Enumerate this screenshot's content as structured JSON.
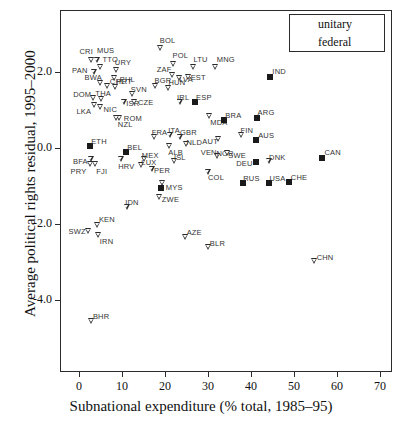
{
  "chart_data": {
    "type": "scatter",
    "title": "",
    "xlabel": "Subnational expenditure (% total, 1985–95)",
    "ylabel": "Average political rights residual, 1995–2000",
    "xlim": [
      -2,
      72
    ],
    "ylim": [
      -5.0,
      3.0
    ],
    "xticks": [
      0,
      10,
      20,
      30,
      40,
      50,
      60,
      70
    ],
    "xticklabels": [
      "0",
      "10",
      "20",
      "30",
      "40",
      "50",
      "60",
      "70"
    ],
    "yticks": [
      2.0,
      0.0,
      -2.0,
      -4.0
    ],
    "yticklabels": [
      "2.0",
      "0.0",
      "-2.0",
      "-4.0"
    ],
    "grid": false,
    "legend": {
      "position": "top-right",
      "entries": [
        {
          "label": "unitary",
          "marker": "triangle-down-open"
        },
        {
          "label": "federal",
          "marker": "square-filled"
        }
      ]
    },
    "series": [
      {
        "name": "unitary",
        "marker": "triangle-down-open",
        "points": [
          {
            "label": "CRI",
            "x": 2.9,
            "y": 2.32,
            "lx": -12,
            "ly": -13
          },
          {
            "label": "MUS",
            "x": 4.2,
            "y": 2.32,
            "lx": 0,
            "ly": -14
          },
          {
            "label": "TTO",
            "x": 5.0,
            "y": 2.14,
            "lx": 2,
            "ly": -12
          },
          {
            "label": "PAN",
            "x": 3.5,
            "y": 2.0,
            "lx": -22,
            "ly": -6
          },
          {
            "label": "URY",
            "x": 8.8,
            "y": 2.04,
            "lx": -2,
            "ly": -12
          },
          {
            "label": "BOL",
            "x": 19.0,
            "y": 2.62,
            "lx": -1,
            "ly": -12
          },
          {
            "label": "POL",
            "x": 22.0,
            "y": 2.22,
            "lx": -1,
            "ly": -13
          },
          {
            "label": "LTU",
            "x": 26.6,
            "y": 2.14,
            "lx": 0,
            "ly": -12
          },
          {
            "label": "MNG",
            "x": 31.8,
            "y": 2.12,
            "lx": 1,
            "ly": -12
          },
          {
            "label": "ZAF",
            "x": 21.8,
            "y": 1.93,
            "lx": -16,
            "ly": -10
          },
          {
            "label": "PHL",
            "x": 8.3,
            "y": 1.85,
            "lx": 5,
            "ly": -3
          },
          {
            "label": "BWA",
            "x": 5.0,
            "y": 1.7,
            "lx": -16,
            "ly": -10
          },
          {
            "label": "CHL",
            "x": 6.7,
            "y": 1.62,
            "lx": 2,
            "ly": -9
          },
          {
            "label": "PRT",
            "x": 8.5,
            "y": 1.6,
            "lx": 1,
            "ly": -10
          },
          {
            "label": "BGR",
            "x": 17.8,
            "y": 1.62,
            "lx": -1,
            "ly": -10
          },
          {
            "label": "HUN",
            "x": 20.8,
            "y": 1.58,
            "lx": 0,
            "ly": -10
          },
          {
            "label": "LVA",
            "x": 23.3,
            "y": 1.83,
            "lx": 0,
            "ly": -3
          },
          {
            "label": "EST",
            "x": 25.5,
            "y": 1.88,
            "lx": 2,
            "ly": -4
          },
          {
            "label": "DOM",
            "x": 3.3,
            "y": 1.32,
            "lx": -20,
            "ly": -8
          },
          {
            "label": "THA",
            "x": 5.2,
            "y": 1.3,
            "lx": -6,
            "ly": -10
          },
          {
            "label": "SVN",
            "x": 12.5,
            "y": 1.42,
            "lx": -2,
            "ly": -9
          },
          {
            "label": "ISR",
            "x": 10.5,
            "y": 1.2,
            "lx": 2,
            "ly": -3
          },
          {
            "label": "CZE",
            "x": 13.0,
            "y": 1.22,
            "lx": 3,
            "ly": -4
          },
          {
            "label": "IRL",
            "x": 23.5,
            "y": 1.22,
            "lx": -3,
            "ly": -9
          },
          {
            "label": "NIC",
            "x": 5.0,
            "y": 1.07,
            "lx": 3,
            "ly": -2
          },
          {
            "label": "LKA",
            "x": 3.6,
            "y": 1.12,
            "lx": -18,
            "ly": 2
          },
          {
            "label": "ROM",
            "x": 9.5,
            "y": 0.8,
            "lx": 4,
            "ly": -4
          },
          {
            "label": "NZL",
            "x": 8.8,
            "y": 0.8,
            "lx": 1,
            "ly": 2
          },
          {
            "label": "MDA",
            "x": 30.3,
            "y": 0.85,
            "lx": 1,
            "ly": 2
          },
          {
            "label": "FRA",
            "x": 17.6,
            "y": 0.28,
            "lx": -3,
            "ly": -9
          },
          {
            "label": "ITA",
            "x": 21.2,
            "y": 0.33,
            "lx": -2,
            "ly": -9
          },
          {
            "label": "GBR",
            "x": 23.5,
            "y": 0.3,
            "lx": 0,
            "ly": -9
          },
          {
            "label": "FIN",
            "x": 37.8,
            "y": 0.33,
            "lx": -1,
            "ly": -9
          },
          {
            "label": "AUT",
            "x": 32.4,
            "y": 0.23,
            "lx": -16,
            "ly": -2
          },
          {
            "label": "NLD",
            "x": 25.0,
            "y": 0.1,
            "lx": 0,
            "ly": -6
          },
          {
            "label": "ALB",
            "x": 21.0,
            "y": 0.06,
            "lx": -1,
            "ly": 2
          },
          {
            "label": "NOR",
            "x": 32.2,
            "y": -0.22,
            "lx": -1,
            "ly": -7
          },
          {
            "label": "SWE",
            "x": 34.5,
            "y": -0.12,
            "lx": 1,
            "ly": -2
          },
          {
            "label": "MEX",
            "x": 15.3,
            "y": -0.28,
            "lx": -3,
            "ly": -8
          },
          {
            "label": "ISL",
            "x": 22.3,
            "y": -0.33,
            "lx": -1,
            "ly": -8
          },
          {
            "label": "DNK",
            "x": 44.2,
            "y": -0.33,
            "lx": 0,
            "ly": -8
          },
          {
            "label": "BFA",
            "x": 2.8,
            "y": -0.28,
            "lx": -18,
            "ly": -2
          },
          {
            "label": "PRY",
            "x": 2.7,
            "y": -0.42,
            "lx": -20,
            "ly": 3
          },
          {
            "label": "FJI",
            "x": 3.8,
            "y": -0.42,
            "lx": 1,
            "ly": 3
          },
          {
            "label": "HRV",
            "x": 9.8,
            "y": -0.3,
            "lx": -3,
            "ly": 3
          },
          {
            "label": "LUX",
            "x": 14.5,
            "y": -0.45,
            "lx": 0,
            "ly": -7
          },
          {
            "label": "PER",
            "x": 17.0,
            "y": -0.55,
            "lx": 2,
            "ly": -3
          },
          {
            "label": "COL",
            "x": 30.0,
            "y": -0.62,
            "lx": 0,
            "ly": 1
          },
          {
            "label": "MYS",
            "x": 19.5,
            "y": -0.93,
            "lx": 3,
            "ly": 0
          },
          {
            "label": "ZWE",
            "x": 18.8,
            "y": -1.3,
            "lx": 2,
            "ly": -2
          },
          {
            "label": "IDN",
            "x": 11.2,
            "y": -1.55,
            "lx": -2,
            "ly": -9
          },
          {
            "label": "KEN",
            "x": 4.4,
            "y": -2.02,
            "lx": 1,
            "ly": -10
          },
          {
            "label": "SWZ",
            "x": 2.2,
            "y": -2.18,
            "lx": -20,
            "ly": -4
          },
          {
            "label": "IRN",
            "x": 4.6,
            "y": -2.3,
            "lx": 1,
            "ly": 2
          },
          {
            "label": "AZE",
            "x": 24.8,
            "y": -2.35,
            "lx": 1,
            "ly": -9
          },
          {
            "label": "BLR",
            "x": 30.2,
            "y": -2.6,
            "lx": 1,
            "ly": -8
          },
          {
            "label": "CHN",
            "x": 54.8,
            "y": -2.97,
            "lx": 2,
            "ly": -8
          },
          {
            "label": "BHR",
            "x": 3.0,
            "y": -4.55,
            "lx": 1,
            "ly": -9
          }
        ]
      },
      {
        "name": "federal",
        "marker": "square-filled",
        "points": [
          {
            "label": "IND",
            "x": 44.5,
            "y": 1.88,
            "lx": 2,
            "ly": -10
          },
          {
            "label": "ESP",
            "x": 27.0,
            "y": 1.2,
            "lx": 1,
            "ly": -9
          },
          {
            "label": "BRA",
            "x": 33.8,
            "y": 0.73,
            "lx": 1,
            "ly": -9
          },
          {
            "label": "ARG",
            "x": 41.3,
            "y": 0.78,
            "lx": 1,
            "ly": -10
          },
          {
            "label": "AUS",
            "x": 41.2,
            "y": 0.22,
            "lx": 2,
            "ly": -9
          },
          {
            "label": "ETH",
            "x": 2.6,
            "y": 0.05,
            "lx": 1,
            "ly": -9
          },
          {
            "label": "BEL",
            "x": 11.0,
            "y": -0.1,
            "lx": 1,
            "ly": -9
          },
          {
            "label": "CHE",
            "x": 48.8,
            "y": -0.9,
            "lx": 2,
            "ly": -9
          },
          {
            "label": "DEU",
            "x": 41.2,
            "y": -0.38,
            "lx": -20,
            "ly": -3
          },
          {
            "label": "USA",
            "x": 44.3,
            "y": -0.92,
            "lx": 0,
            "ly": -9
          },
          {
            "label": "RUS",
            "x": 38.2,
            "y": -0.93,
            "lx": 0,
            "ly": -9
          },
          {
            "label": "CAN",
            "x": 56.6,
            "y": -0.25,
            "lx": 2,
            "ly": -10
          },
          {
            "label": "VEN",
            "x": 19.0,
            "y": -1.05,
            "lx": 40,
            "ly": -40
          }
        ]
      }
    ]
  },
  "axis_geometry": {
    "x0_px": 79,
    "x_per_unit_px": 4.3,
    "y0_px": 148,
    "y_per_unit_px": 38.0
  }
}
